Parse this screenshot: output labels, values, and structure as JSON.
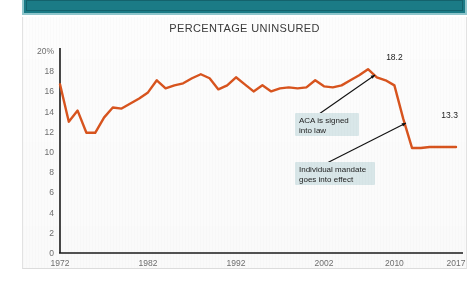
{
  "topbar": {
    "color": "#1b7b86",
    "border_color": "#8fc6cc"
  },
  "chart_data": {
    "type": "line",
    "title": "PERCENTAGE UNINSURED",
    "xlabel": "",
    "ylabel": "",
    "grid": false,
    "legend": "none",
    "line_color": "#d9541e",
    "xlim": [
      1972,
      2017
    ],
    "ylim": [
      0,
      20
    ],
    "ytick_labels": [
      "20%",
      "18",
      "16",
      "14",
      "12",
      "10",
      "8",
      "6",
      "4",
      "2",
      "0"
    ],
    "ytick_values": [
      20,
      18,
      16,
      14,
      12,
      10,
      8,
      6,
      4,
      2,
      0
    ],
    "xtick_labels": [
      "1972",
      "1982",
      "1992",
      "2002",
      "2010",
      "2017"
    ],
    "xtick_values": [
      1972,
      1982,
      1992,
      2002,
      2010,
      2017
    ],
    "x": [
      1972,
      1973,
      1974,
      1975,
      1976,
      1977,
      1978,
      1979,
      1980,
      1981,
      1982,
      1983,
      1984,
      1985,
      1986,
      1987,
      1988,
      1989,
      1990,
      1991,
      1992,
      1993,
      1994,
      1995,
      1996,
      1997,
      1998,
      1999,
      2000,
      2001,
      2002,
      2003,
      2004,
      2005,
      2006,
      2007,
      2008,
      2009,
      2010,
      2011,
      2012,
      2013,
      2014,
      2015,
      2016,
      2017
    ],
    "values": [
      16.7,
      13.0,
      14.1,
      11.9,
      11.9,
      13.4,
      14.4,
      14.3,
      14.8,
      15.3,
      15.9,
      17.1,
      16.3,
      16.6,
      16.8,
      17.3,
      17.7,
      17.3,
      16.2,
      16.6,
      17.4,
      16.7,
      16.0,
      16.6,
      16.0,
      16.3,
      16.4,
      16.3,
      16.4,
      17.1,
      16.5,
      16.4,
      16.6,
      17.1,
      17.6,
      18.2,
      17.4,
      17.1,
      16.6,
      13.3,
      10.4,
      10.4,
      10.5,
      10.5,
      10.5,
      10.5
    ],
    "point_labels": [
      {
        "year": 2010,
        "value": 18.2,
        "text": "18.2"
      },
      {
        "year": 2014,
        "value": 13.3,
        "text": "13.3"
      }
    ],
    "annotations": [
      {
        "id": "aca",
        "text_line1": "ACA is signed",
        "text_line2": "into law",
        "points_to_year": 2010,
        "points_to_value": 18.2,
        "bg": "#dae8ea"
      },
      {
        "id": "mandate",
        "text_line1": "Individual mandate",
        "text_line2": "goes into effect",
        "points_to_year": 2014,
        "points_to_value": 13.3,
        "bg": "#dae8ea"
      }
    ]
  }
}
